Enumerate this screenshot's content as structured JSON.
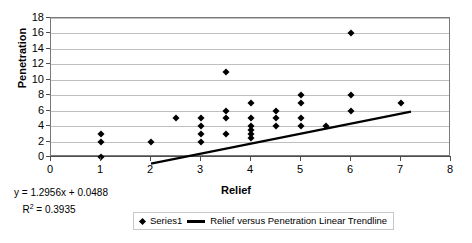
{
  "chart_data": {
    "type": "scatter",
    "title": "",
    "xlabel": "Relief",
    "ylabel": "Penetration",
    "xlim": [
      0,
      8
    ],
    "ylim": [
      0,
      18
    ],
    "xticks": [
      0,
      1,
      2,
      3,
      4,
      5,
      6,
      7,
      8
    ],
    "yticks": [
      0,
      2,
      4,
      6,
      8,
      10,
      12,
      14,
      16,
      18
    ],
    "grid": "horizontal",
    "legend_position": "bottom",
    "series": [
      {
        "name": "Series1",
        "marker": "diamond",
        "color": "#000000",
        "points": [
          [
            1,
            0
          ],
          [
            1,
            2
          ],
          [
            1,
            3
          ],
          [
            2,
            2
          ],
          [
            2.5,
            5
          ],
          [
            3,
            2
          ],
          [
            3,
            3
          ],
          [
            3,
            4
          ],
          [
            3,
            5
          ],
          [
            3.5,
            3
          ],
          [
            3.5,
            5
          ],
          [
            3.5,
            6
          ],
          [
            3.5,
            11
          ],
          [
            4,
            2.5
          ],
          [
            4,
            3
          ],
          [
            4,
            3.5
          ],
          [
            4,
            4
          ],
          [
            4,
            5
          ],
          [
            4,
            7
          ],
          [
            4.5,
            4
          ],
          [
            4.5,
            5
          ],
          [
            4.5,
            6
          ],
          [
            5,
            4
          ],
          [
            5,
            5
          ],
          [
            5,
            7
          ],
          [
            5,
            8
          ],
          [
            5.5,
            4
          ],
          [
            6,
            6
          ],
          [
            6,
            8
          ],
          [
            6,
            16
          ],
          [
            7,
            7
          ]
        ]
      }
    ],
    "trendline": {
      "name": "Relief versus Penetration Linear Trendline",
      "slope": 1.2956,
      "intercept": 0.0488,
      "equation": "y = 1.2956x + 0.0488",
      "r_squared_label": "R",
      "r_squared_exp": "2",
      "r_squared_value": "= 0.3935",
      "r_squared": 0.3935,
      "x_start": 1,
      "x_end": 6.2,
      "color": "#000000"
    }
  },
  "axes": {
    "y_title": "Penetration",
    "x_title": "Relief",
    "y_tick_labels": [
      "18",
      "16",
      "14",
      "12",
      "10",
      "8",
      "6",
      "4",
      "2",
      "0"
    ],
    "x_tick_labels": [
      "0",
      "1",
      "2",
      "3",
      "4",
      "5",
      "6",
      "7",
      "8"
    ]
  },
  "annotations": {
    "equation": "y = 1.2956x + 0.0488",
    "r2_prefix": "R",
    "r2_sup": "2",
    "r2_rest": " = 0.3935"
  },
  "legend": {
    "series_label": "Series1",
    "trendline_label": "Relief versus Penetration Linear Trendline"
  }
}
